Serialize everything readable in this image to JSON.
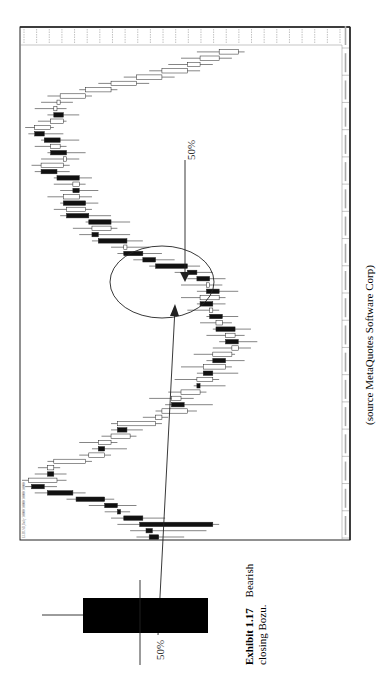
{
  "figure": {
    "exhibit_label": "Exhibit 1.17",
    "caption_rest_line1": "Bearish",
    "caption_line2": "closing Bozu.",
    "source": "(source MetaQuotes Software Corp)",
    "chart_pct_label": "50%",
    "diagram_pct_label": "50%",
    "chart_header_text": "EURUSD,Daily  1.0000 1.0000 1.0000 1.0000"
  },
  "chart_data": {
    "type": "candlestick",
    "title": "",
    "orientation_note": "page rotated 90° clockwise; time runs bottom-to-top, price increases left-to-right",
    "xlabel": "Date",
    "ylabel": "Price",
    "price_units": "relative (0 = left edge, 100 = right edge); axis tick labels illegible",
    "ylim": [
      0,
      100
    ],
    "date_tick_count": 19,
    "price_tick_count": 26,
    "grid": false,
    "candles": [
      {
        "i": 0,
        "o": 43,
        "h": 51,
        "l": 36,
        "c": 40,
        "bear": true
      },
      {
        "i": 1,
        "o": 41,
        "h": 58,
        "l": 34,
        "c": 39,
        "bear": true
      },
      {
        "i": 2,
        "o": 60,
        "h": 62,
        "l": 30,
        "c": 37,
        "bear": false
      },
      {
        "i": 3,
        "o": 38,
        "h": 45,
        "l": 28,
        "c": 32,
        "bear": true
      },
      {
        "i": 4,
        "o": 31,
        "h": 34,
        "l": 26,
        "c": 30,
        "bear": true
      },
      {
        "i": 5,
        "o": 30,
        "h": 36,
        "l": 21,
        "c": 26,
        "bear": true
      },
      {
        "i": 6,
        "o": 26,
        "h": 29,
        "l": 14,
        "c": 17,
        "bear": true
      },
      {
        "i": 7,
        "o": 16,
        "h": 20,
        "l": 4,
        "c": 8,
        "bear": true
      },
      {
        "i": 8,
        "o": 7,
        "h": 11,
        "l": 1,
        "c": 3,
        "bear": true
      },
      {
        "i": 9,
        "o": 2,
        "h": 14,
        "l": 0,
        "c": 11,
        "bear": false
      },
      {
        "i": 10,
        "o": 10,
        "h": 14,
        "l": 4,
        "c": 8,
        "bear": true
      }
    ],
    "shown_candles_summary": "~80 daily candles: decline, rally, pullback, breakdown (bearish closing bozu circled), then rally to top",
    "annotations": [
      {
        "type": "ellipse",
        "target": "bearish closing bozu candles mid-chart"
      },
      {
        "type": "arrow",
        "label": "50%",
        "direction": "down-into-ellipse"
      },
      {
        "type": "arrow",
        "from": "diagram candle",
        "direction": "up-into-ellipse"
      }
    ],
    "legend": "none"
  },
  "diagram_candle": {
    "type": "bearish closing bozu",
    "body_color": "#000000",
    "upper_shadow": true,
    "lower_shadow": false,
    "midpoint_marker": "50%"
  },
  "colors": {
    "bear_body": "#111111",
    "bull_body": "#ffffff",
    "frame": "#222222",
    "text": "#1a1a1a"
  }
}
